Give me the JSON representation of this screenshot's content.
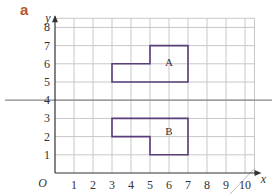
{
  "part_label": "a",
  "colors": {
    "grid": "#c8c8c8",
    "axis": "#333333",
    "shape": "#5a3e7a",
    "mirror_line": "#888888",
    "part_label": "#b5562a"
  },
  "axes": {
    "x_label": "x",
    "y_label": "y",
    "origin_label": "O",
    "x_ticks": [
      "1",
      "2",
      "3",
      "4",
      "5",
      "6",
      "7",
      "8",
      "9",
      "10"
    ],
    "y_ticks": [
      "1",
      "2",
      "3",
      "4",
      "5",
      "6",
      "7",
      "8"
    ],
    "x_range": [
      0,
      11
    ],
    "y_range": [
      0,
      8.5
    ]
  },
  "mirror_line": {
    "equation": "y = 4"
  },
  "shapes": [
    {
      "label": "A",
      "points": [
        [
          3,
          5
        ],
        [
          7,
          5
        ],
        [
          7,
          7
        ],
        [
          5,
          7
        ],
        [
          5,
          6
        ],
        [
          3,
          6
        ]
      ],
      "label_pos": [
        6,
        5.9
      ]
    },
    {
      "label": "B",
      "points": [
        [
          3,
          3
        ],
        [
          7,
          3
        ],
        [
          7,
          1
        ],
        [
          5,
          1
        ],
        [
          5,
          2
        ],
        [
          3,
          2
        ]
      ],
      "label_pos": [
        6,
        2.1
      ]
    }
  ]
}
